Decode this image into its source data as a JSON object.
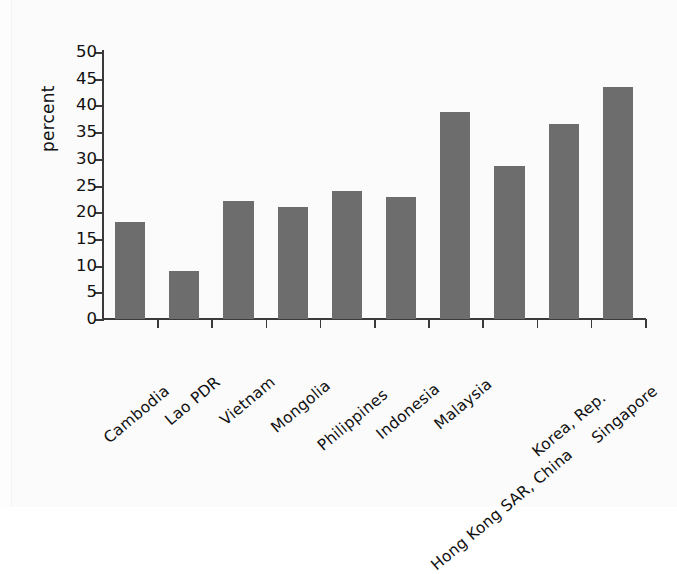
{
  "chart_data": {
    "type": "bar",
    "title": "",
    "xlabel": "",
    "ylabel": "percent",
    "ylim": [
      0,
      50
    ],
    "ytick_step": 5,
    "yticks": [
      50,
      45,
      40,
      35,
      30,
      25,
      20,
      15,
      10,
      5,
      0
    ],
    "grid": false,
    "legend": "none",
    "bar_color": "#6d6d6d",
    "axis_color": "#3a3a3a",
    "background_color": "#fbfbfb",
    "categories": [
      "Cambodia",
      "Lao PDR",
      "Vietnam",
      "Mongolia",
      "Philippines",
      "Indonesia",
      "Malaysia",
      "Hong Kong SAR, China",
      "Korea, Rep.",
      "Singapore"
    ],
    "values": [
      18.1,
      9.0,
      22.1,
      21.0,
      24.0,
      22.8,
      38.8,
      28.7,
      36.6,
      43.5
    ]
  }
}
